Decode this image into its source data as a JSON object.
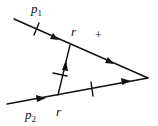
{
  "diagram": {
    "type": "feynman-cut-diagram",
    "labels": {
      "p1": {
        "base": "p",
        "sub": "1"
      },
      "p2": {
        "base": "p",
        "sub": "2"
      },
      "r_upper": "r",
      "r_lower": "r",
      "sign": "+"
    },
    "colors": {
      "line": "#111111",
      "background": "#ffffff"
    },
    "lines": [
      {
        "name": "upper-propagator",
        "from": "p1",
        "to": "vertex-right",
        "arrows": 2,
        "cut": true
      },
      {
        "name": "lower-propagator",
        "from": "p2",
        "to": "vertex-right",
        "arrows": 2,
        "cut": true
      },
      {
        "name": "rung-propagator",
        "from": "lower",
        "to": "upper",
        "arrows": 1,
        "cut": true
      }
    ]
  }
}
